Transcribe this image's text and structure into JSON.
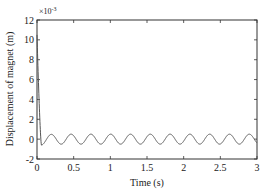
{
  "chart_data": {
    "type": "line",
    "title": "",
    "xlabel": "Time (s)",
    "ylabel": "Displacement of magnet (m)",
    "y_multiplier": "×10",
    "y_multiplier_exp": "-3",
    "xlim": [
      0,
      3
    ],
    "ylim": [
      -2,
      12
    ],
    "x_ticks": [
      "0",
      "0.5",
      "1",
      "1.5",
      "2",
      "2.5",
      "3"
    ],
    "y_ticks": [
      "-2",
      "0",
      "2",
      "4",
      "6",
      "8",
      "10",
      "12"
    ],
    "grid": false,
    "legend": null,
    "series": [
      {
        "name": "displacement",
        "color": "#555555",
        "description": "Starts near 10.5e-3 m at t=0, drops steeply to about -0.6e-3 m at t≈0.06 s, then oscillates steadily about 0 with amplitude ≈0.5e-3 m and period ≈0.27 s (≈11 cycles over 3 s).",
        "initial_value": 10.5,
        "min_after_drop": -0.6,
        "steady_amplitude": 0.5,
        "steady_offset": 0.0,
        "period_s": 0.27,
        "x": [
          0,
          0.02,
          0.04,
          0.06,
          0.1,
          0.2,
          0.3,
          0.5,
          1.0,
          1.5,
          2.0,
          2.5,
          3.0
        ],
        "y": [
          10.5,
          5.5,
          1.5,
          -0.6,
          -0.2,
          0.4,
          -0.3,
          0.3,
          0.0,
          0.2,
          -0.1,
          0.3,
          -0.4
        ]
      }
    ]
  }
}
